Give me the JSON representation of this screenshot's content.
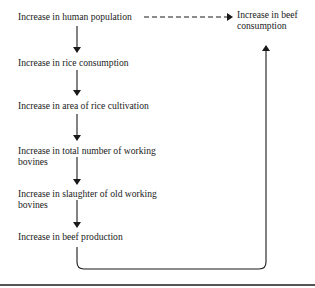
{
  "diagram": {
    "nodes": [
      {
        "id": "human-population",
        "lines": [
          "Increase in human population"
        ]
      },
      {
        "id": "rice-consumption",
        "lines": [
          "Increase in rice consumption"
        ]
      },
      {
        "id": "rice-cultivation-area",
        "lines": [
          "Increase in area of rice cultivation"
        ]
      },
      {
        "id": "working-bovines",
        "lines": [
          "Increase in total number of working",
          "bovines"
        ]
      },
      {
        "id": "slaughter-old-bovines",
        "lines": [
          "Increase in slaughter of old working",
          "bovines"
        ]
      },
      {
        "id": "beef-production",
        "lines": [
          "Increase in beef production"
        ]
      },
      {
        "id": "beef-consumption",
        "lines": [
          "Increase in beef",
          "consumption"
        ]
      }
    ],
    "edges": [
      {
        "from": "human-population",
        "to": "beef-consumption",
        "style": "dashed"
      },
      {
        "from": "human-population",
        "to": "rice-consumption",
        "style": "solid"
      },
      {
        "from": "rice-consumption",
        "to": "rice-cultivation-area",
        "style": "solid"
      },
      {
        "from": "rice-cultivation-area",
        "to": "working-bovines",
        "style": "solid"
      },
      {
        "from": "working-bovines",
        "to": "slaughter-old-bovines",
        "style": "solid"
      },
      {
        "from": "slaughter-old-bovines",
        "to": "beef-production",
        "style": "solid"
      },
      {
        "from": "beef-production",
        "to": "beef-consumption",
        "style": "solid-loop"
      }
    ],
    "colors": {
      "line": "#1a1a1a",
      "text": "#1a1a1a",
      "background": "#ffffff"
    }
  }
}
